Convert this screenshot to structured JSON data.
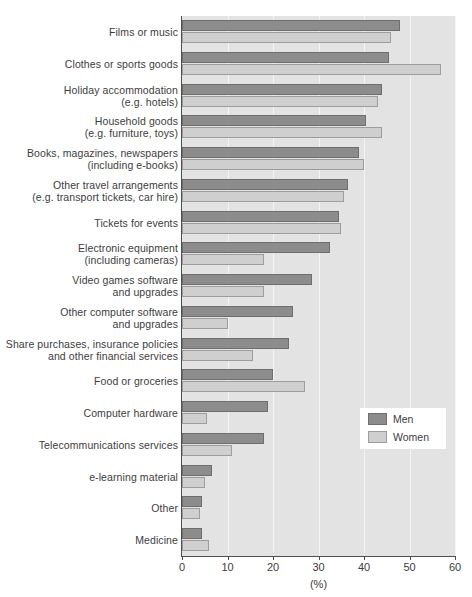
{
  "chart_data": {
    "type": "bar",
    "orientation": "horizontal",
    "title": "",
    "xlabel": "(%)",
    "ylabel": "",
    "xlim": [
      0,
      60
    ],
    "xticks": [
      0,
      10,
      20,
      30,
      40,
      50,
      60
    ],
    "grid": true,
    "legend_position": "inside-right",
    "colors": {
      "men": "#8c8c8c",
      "women": "#cfcfcf",
      "men_border": "#6e6e6e",
      "women_border": "#9d9d9d",
      "plot_background": "#e3e3e3",
      "gridline": "#f4f4f4",
      "axis": "#4d4d4d",
      "text": "#3d3d3d"
    },
    "categories": [
      "Films or music",
      "Clothes or sports goods",
      "Holiday accommodation (e.g. hotels)",
      "Household goods (e.g. furniture, toys)",
      "Books, magazines, newspapers (including e-books)",
      "Other travel arrangements (e.g. transport tickets, car hire)",
      "Tickets for events",
      "Electronic equipment (including cameras)",
      "Video games software and upgrades",
      "Other computer software and upgrades",
      "Share purchases, insurance policies and other financial services",
      "Food or groceries",
      "Computer hardware",
      "Telecommunications services",
      "e-learning material",
      "Other",
      "Medicine"
    ],
    "series": [
      {
        "name": "Men",
        "values": [
          48,
          45.5,
          44,
          40.5,
          39,
          36.5,
          34.5,
          32.5,
          28.5,
          24.5,
          23.5,
          20,
          19,
          18,
          6.5,
          4.5,
          4.5
        ]
      },
      {
        "name": "Women",
        "values": [
          46,
          57,
          43,
          44,
          40,
          35.5,
          35,
          18,
          18,
          10,
          15.5,
          27,
          5.5,
          11,
          5,
          4,
          6
        ]
      }
    ]
  },
  "rows": [
    {
      "line1": "Films or music",
      "line2": "",
      "men": 48,
      "women": 46
    },
    {
      "line1": "Clothes or sports goods",
      "line2": "",
      "men": 45.5,
      "women": 57
    },
    {
      "line1": "Holiday accommodation",
      "line2": "(e.g. hotels)",
      "men": 44,
      "women": 43
    },
    {
      "line1": "Household goods",
      "line2": "(e.g. furniture, toys)",
      "men": 40.5,
      "women": 44
    },
    {
      "line1": "Books, magazines, newspapers",
      "line2": "(including e-books)",
      "men": 39,
      "women": 40
    },
    {
      "line1": "Other travel arrangements",
      "line2": "(e.g. transport tickets, car hire)",
      "men": 36.5,
      "women": 35.5
    },
    {
      "line1": "Tickets for events",
      "line2": "",
      "men": 34.5,
      "women": 35
    },
    {
      "line1": "Electronic equipment",
      "line2": "(including cameras)",
      "men": 32.5,
      "women": 18
    },
    {
      "line1": "Video games software",
      "line2": "and upgrades",
      "men": 28.5,
      "women": 18
    },
    {
      "line1": "Other computer software",
      "line2": "and upgrades",
      "men": 24.5,
      "women": 10
    },
    {
      "line1": "Share purchases, insurance policies",
      "line2": "and other financial services",
      "men": 23.5,
      "women": 15.5
    },
    {
      "line1": "Food or groceries",
      "line2": "",
      "men": 20,
      "women": 27
    },
    {
      "line1": "Computer hardware",
      "line2": "",
      "men": 19,
      "women": 5.5
    },
    {
      "line1": "Telecommunications services",
      "line2": "",
      "men": 18,
      "women": 11
    },
    {
      "line1": "e-learning material",
      "line2": "",
      "men": 6.5,
      "women": 5
    },
    {
      "line1": "Other",
      "line2": "",
      "men": 4.5,
      "women": 4
    },
    {
      "line1": "Medicine",
      "line2": "",
      "men": 4.5,
      "women": 6
    }
  ],
  "axis": {
    "ticks": [
      "0",
      "10",
      "20",
      "30",
      "40",
      "50",
      "60"
    ],
    "title": "(%)"
  },
  "legend": {
    "men_label": "Men",
    "women_label": "Women"
  }
}
